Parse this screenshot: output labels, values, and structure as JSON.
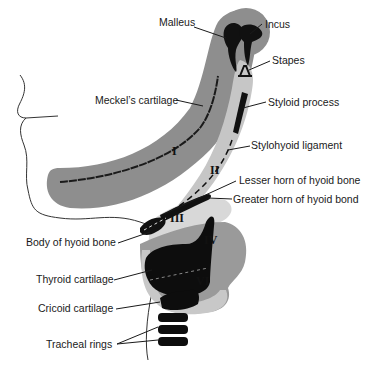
{
  "diagram": {
    "colors": {
      "arch_dark": "#8c8c8c",
      "arch_light": "#c4c4c4",
      "arch_lighter": "#d9d9d9",
      "bone_black": "#111111",
      "outline": "#333333"
    },
    "labels": {
      "malleus": "Malleus",
      "incus": "Incus",
      "stapes": "Stapes",
      "meckels": "Meckel’s cartilage",
      "styloid": "Styloid process",
      "stylohyoid": "Stylohyoid ligament",
      "lesser_horn": "Lesser horn of hyoid bone",
      "greater_horn": "Greater horn of hyoid bond",
      "body_hyoid": "Body of hyoid bone",
      "thyroid": "Thyroid cartilage",
      "cricoid": "Cricoid cartilage",
      "tracheal": "Tracheal rings"
    },
    "arches": {
      "I": "I",
      "II": "II",
      "III": "III",
      "IV": "IV",
      "VI": "VI"
    }
  }
}
